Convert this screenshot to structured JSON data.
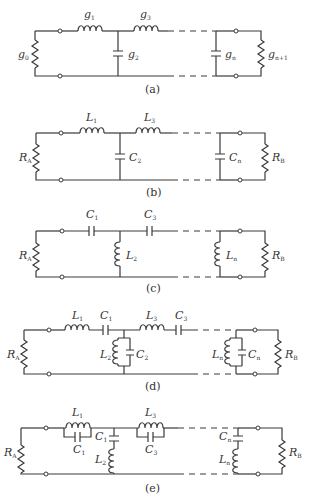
{
  "figure": {
    "panels": [
      {
        "id": "a",
        "caption": "(a)",
        "description": "Lowpass prototype ladder network with normalized element values",
        "source_label": {
          "main": "g",
          "sub": "0"
        },
        "load_label": {
          "main": "g",
          "sub": "n+1"
        },
        "elements": [
          {
            "type": "series-inductor",
            "label": "g",
            "sub": "1"
          },
          {
            "type": "shunt-capacitor",
            "label": "g",
            "sub": "2"
          },
          {
            "type": "series-inductor",
            "label": "g",
            "sub": "3"
          },
          {
            "type": "shunt-capacitor",
            "label": "g",
            "sub": "n"
          }
        ]
      },
      {
        "id": "b",
        "caption": "(b)",
        "description": "Lowpass filter",
        "source_label": {
          "main": "R",
          "sub": "A"
        },
        "load_label": {
          "main": "R",
          "sub": "B"
        },
        "elements": [
          {
            "type": "series-inductor",
            "label": "L",
            "sub": "1"
          },
          {
            "type": "shunt-capacitor",
            "label": "C",
            "sub": "2"
          },
          {
            "type": "series-inductor",
            "label": "L",
            "sub": "3"
          },
          {
            "type": "shunt-capacitor",
            "label": "C",
            "sub": "n"
          }
        ]
      },
      {
        "id": "c",
        "caption": "(c)",
        "description": "Highpass filter",
        "source_label": {
          "main": "R",
          "sub": "A"
        },
        "load_label": {
          "main": "R",
          "sub": "B"
        },
        "elements": [
          {
            "type": "series-capacitor",
            "label": "C",
            "sub": "1"
          },
          {
            "type": "shunt-inductor",
            "label": "L",
            "sub": "2"
          },
          {
            "type": "series-capacitor",
            "label": "C",
            "sub": "3"
          },
          {
            "type": "shunt-inductor",
            "label": "L",
            "sub": "n"
          }
        ]
      },
      {
        "id": "d",
        "caption": "(d)",
        "description": "Bandpass filter",
        "source_label": {
          "main": "R",
          "sub": "A"
        },
        "load_label": {
          "main": "R",
          "sub": "B"
        },
        "elements": [
          {
            "type": "series-LC",
            "labels": [
              {
                "label": "L",
                "sub": "1"
              },
              {
                "label": "C",
                "sub": "1"
              }
            ]
          },
          {
            "type": "shunt-parallel-LC",
            "labels": [
              {
                "label": "L",
                "sub": "2"
              },
              {
                "label": "C",
                "sub": "2"
              }
            ]
          },
          {
            "type": "series-LC",
            "labels": [
              {
                "label": "L",
                "sub": "3"
              },
              {
                "label": "C",
                "sub": "3"
              }
            ]
          },
          {
            "type": "shunt-parallel-LC",
            "labels": [
              {
                "label": "L",
                "sub": "n"
              },
              {
                "label": "C",
                "sub": "n"
              }
            ]
          }
        ]
      },
      {
        "id": "e",
        "caption": "(e)",
        "description": "Bandstop filter",
        "source_label": {
          "main": "R",
          "sub": "A"
        },
        "load_label": {
          "main": "R",
          "sub": "B"
        },
        "elements": [
          {
            "type": "series-parallel-LC",
            "labels": [
              {
                "label": "L",
                "sub": "1"
              },
              {
                "label": "C",
                "sub": "1"
              }
            ]
          },
          {
            "type": "shunt-series-LC",
            "labels": [
              {
                "label": "C",
                "sub": "1"
              },
              {
                "label": "L",
                "sub": "2"
              }
            ]
          },
          {
            "type": "series-parallel-LC",
            "labels": [
              {
                "label": "L",
                "sub": "3"
              },
              {
                "label": "C",
                "sub": "3"
              }
            ]
          },
          {
            "type": "shunt-series-LC",
            "labels": [
              {
                "label": "C",
                "sub": "n"
              },
              {
                "label": "L",
                "sub": "n"
              }
            ]
          }
        ]
      }
    ]
  },
  "labels": {
    "a": {
      "caption": "(a)",
      "g0": "g",
      "g0s": "0",
      "g1": "g",
      "g1s": "1",
      "g2": "g",
      "g2s": "2",
      "g3": "g",
      "g3s": "3",
      "gn": "g",
      "gns": "n",
      "gn1": "g",
      "gn1s": "n+1"
    },
    "b": {
      "caption": "(b)",
      "RA": "R",
      "RAs": "A",
      "L1": "L",
      "L1s": "1",
      "C2": "C",
      "C2s": "2",
      "L3": "L",
      "L3s": "3",
      "Cn": "C",
      "Cns": "n",
      "RB": "R",
      "RBs": "B"
    },
    "c": {
      "caption": "(c)",
      "RA": "R",
      "RAs": "A",
      "C1": "C",
      "C1s": "1",
      "L2": "L",
      "L2s": "2",
      "C3": "C",
      "C3s": "3",
      "Ln": "L",
      "Lns": "n",
      "RB": "R",
      "RBs": "B"
    },
    "d": {
      "caption": "(d)",
      "RA": "R",
      "RAs": "A",
      "L1": "L",
      "L1s": "1",
      "C1": "C",
      "C1s": "1",
      "L2": "L",
      "L2s": "2",
      "C2": "C",
      "C2s": "2",
      "L3": "L",
      "L3s": "3",
      "C3": "C",
      "C3s": "3",
      "Ln": "L",
      "Lns": "n",
      "Cn": "C",
      "Cns": "n",
      "RB": "R",
      "RBs": "B"
    },
    "e": {
      "caption": "(e)",
      "RA": "R",
      "RAs": "A",
      "L1": "L",
      "L1s": "1",
      "C1": "C",
      "C1s": "1",
      "C1b": "C",
      "C1bs": "1",
      "L2": "L",
      "L2s": "2",
      "L3": "L",
      "L3s": "3",
      "C3": "C",
      "C3s": "3",
      "Cn": "C",
      "Cns": "n",
      "Ln": "L",
      "Lns": "n",
      "RB": "R",
      "RBs": "B"
    }
  }
}
